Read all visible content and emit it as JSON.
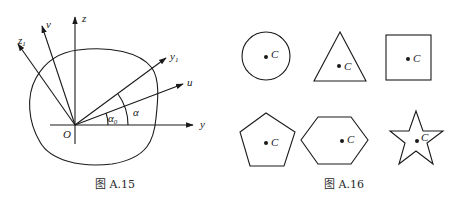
{
  "figures": [
    {
      "id": "fig-a15",
      "caption": "图 A.15",
      "origin_label": "O",
      "axes": [
        {
          "name": "z",
          "label": "z",
          "sub": ""
        },
        {
          "name": "y",
          "label": "y",
          "sub": ""
        },
        {
          "name": "v",
          "label": "v",
          "sub": ""
        },
        {
          "name": "z1",
          "label": "z",
          "sub": "1"
        },
        {
          "name": "y1",
          "label": "y",
          "sub": "1"
        },
        {
          "name": "u",
          "label": "u",
          "sub": ""
        }
      ],
      "angles": [
        {
          "name": "alpha0",
          "label": "α",
          "sub": "0"
        },
        {
          "name": "alpha",
          "label": "α",
          "sub": ""
        }
      ]
    },
    {
      "id": "fig-a16",
      "caption": "图 A.16",
      "shapes": [
        {
          "shape": "circle",
          "centroid_label": "C"
        },
        {
          "shape": "triangle",
          "centroid_label": "C"
        },
        {
          "shape": "square",
          "centroid_label": "C"
        },
        {
          "shape": "pentagon",
          "centroid_label": "C"
        },
        {
          "shape": "hexagon",
          "centroid_label": "C"
        },
        {
          "shape": "star",
          "centroid_label": "C"
        }
      ]
    }
  ]
}
